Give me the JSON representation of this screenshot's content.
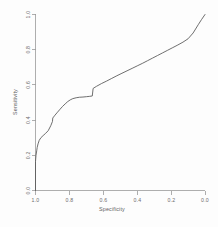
{
  "chart_data": {
    "type": "line",
    "title": "",
    "xlabel": "Specificity",
    "ylabel": "Sensitivity",
    "xlim": [
      1.0,
      0.0
    ],
    "ylim": [
      0.0,
      1.0
    ],
    "x_reversed": true,
    "grid": false,
    "legend": null,
    "xticks": [
      "1.0",
      "0.8",
      "0.6",
      "0.4",
      "0.2",
      "0.0"
    ],
    "xtick_values": [
      1.0,
      0.8,
      0.6,
      0.4,
      0.2,
      0.0
    ],
    "yticks": [
      "0.0",
      "0.2",
      "0.4",
      "0.6",
      "0.8",
      "1.0"
    ],
    "ytick_values": [
      0.0,
      0.2,
      0.4,
      0.6,
      0.8,
      1.0
    ],
    "line_color": "#555555",
    "series": [
      {
        "name": "ROC curve",
        "x": [
          1.0,
          1.0,
          0.997,
          0.993,
          0.99,
          0.985,
          0.978,
          0.968,
          0.955,
          0.94,
          0.925,
          0.91,
          0.9,
          0.898,
          0.885,
          0.87,
          0.855,
          0.84,
          0.825,
          0.81,
          0.795,
          0.78,
          0.76,
          0.74,
          0.72,
          0.7,
          0.68,
          0.665,
          0.66,
          0.64,
          0.61,
          0.58,
          0.55,
          0.52,
          0.49,
          0.46,
          0.43,
          0.4,
          0.37,
          0.34,
          0.31,
          0.28,
          0.25,
          0.22,
          0.19,
          0.16,
          0.13,
          0.1,
          0.07,
          0.04,
          0.02,
          0.0
        ],
        "y": [
          0.0,
          0.165,
          0.2,
          0.225,
          0.245,
          0.265,
          0.285,
          0.3,
          0.312,
          0.325,
          0.34,
          0.368,
          0.392,
          0.412,
          0.428,
          0.445,
          0.462,
          0.478,
          0.492,
          0.505,
          0.515,
          0.522,
          0.527,
          0.53,
          0.531,
          0.533,
          0.535,
          0.537,
          0.58,
          0.592,
          0.608,
          0.622,
          0.637,
          0.652,
          0.666,
          0.68,
          0.694,
          0.708,
          0.722,
          0.737,
          0.752,
          0.767,
          0.782,
          0.797,
          0.812,
          0.827,
          0.843,
          0.862,
          0.895,
          0.942,
          0.972,
          1.0
        ]
      }
    ],
    "notes": [
      "Steep near-vertical rise at Specificity = 1.0 from Sensitivity 0 to ~0.17",
      "Plateau of Sensitivity near 0.53 between Specificity 0.78 and 0.66",
      "Small vertical step jump at Specificity ~0.66 up to Sensitivity ~0.58",
      "Near-linear ascent to the top-right corner at (0.0, 1.0)"
    ]
  },
  "axes": {
    "x_title": "Specificity",
    "y_title": "Sensitivity"
  }
}
